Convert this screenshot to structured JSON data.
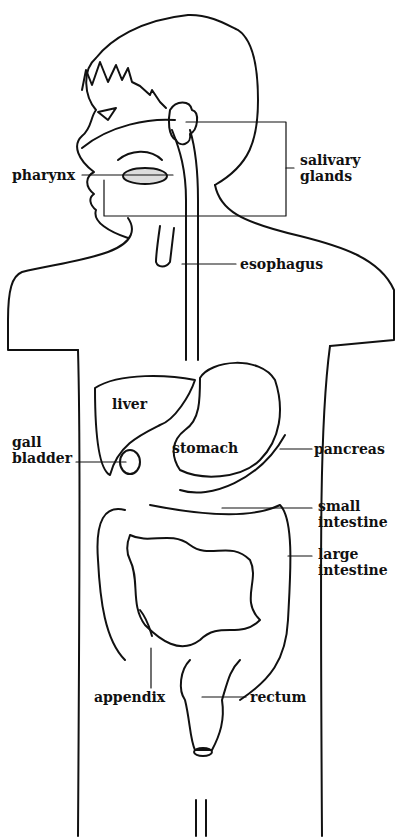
{
  "diagram": {
    "labels": {
      "pharynx": "pharynx",
      "salivary_glands_line1": "salivary",
      "salivary_glands_line2": "glands",
      "esophagus": "esophagus",
      "liver": "liver",
      "gall_bladder_line1": "gall",
      "gall_bladder_line2": "bladder",
      "stomach": "stomach",
      "pancreas": "pancreas",
      "small_intestine_line1": "small",
      "small_intestine_line2": "intestine",
      "large_intestine_line1": "large",
      "large_intestine_line2": "intestine",
      "appendix": "appendix",
      "rectum": "rectum"
    },
    "colors": {
      "ink": "#111111",
      "background": "#ffffff"
    }
  }
}
